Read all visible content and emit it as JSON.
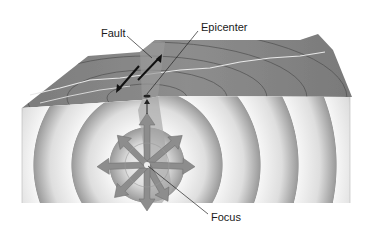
{
  "diagram": {
    "labels": {
      "fault": "Fault",
      "epicenter": "Epicenter",
      "focus": "Focus"
    },
    "colors": {
      "surface": "#8a8a8a",
      "surface_dark": "#6e6e6e",
      "front_light": "#f2f2f2",
      "front_dark": "#9a9a9a",
      "arrow": "#8c8c8c",
      "line": "#1a1a1a",
      "crack": "#e6e6e6"
    }
  }
}
